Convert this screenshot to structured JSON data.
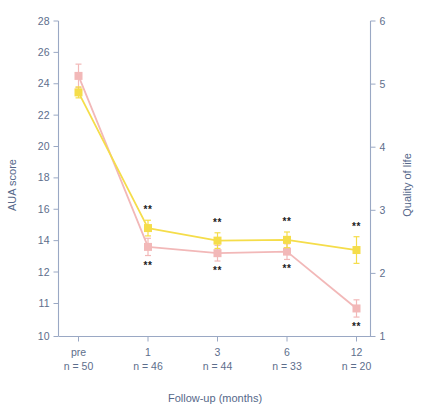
{
  "chart_data": {
    "type": "line",
    "title": "",
    "xlabel": "Follow-up (months)",
    "ylabel": "AUA score",
    "y2label": "Quality of life",
    "categories": [
      "pre",
      "1",
      "3",
      "6",
      "12"
    ],
    "category_sublabels": [
      "n = 50",
      "n = 46",
      "n = 44",
      "n = 33",
      "n = 20"
    ],
    "ylim": [
      10,
      28
    ],
    "yticks": [
      10,
      11,
      12,
      14,
      16,
      18,
      20,
      22,
      24,
      26,
      28
    ],
    "ytick_labels": [
      "10",
      "11",
      "12",
      "14",
      "16",
      "18",
      "20",
      "22",
      "24",
      "26",
      "28"
    ],
    "y2lim": [
      1,
      6
    ],
    "y2ticks": [
      1,
      2,
      3,
      4,
      5,
      6
    ],
    "y2tick_labels": [
      "1",
      "2",
      "3",
      "4",
      "5",
      "6"
    ],
    "grid": false,
    "legend_position": "none",
    "series": [
      {
        "name": "AUA score",
        "axis": "left",
        "color": "#f2b8b8",
        "marker": "square",
        "values": [
          24.5,
          13.6,
          13.2,
          13.3,
          10.85
        ],
        "errors": [
          0.75,
          0.55,
          0.5,
          0.5,
          0.55
        ],
        "significance": [
          "",
          "**",
          "**",
          "**",
          "**"
        ],
        "significance_position": "below"
      },
      {
        "name": "Quality of life",
        "axis": "right",
        "color": "#f5dd4a",
        "marker": "square",
        "values": [
          23.45,
          14.8,
          14.0,
          14.05,
          13.4
        ],
        "errors": [
          0.35,
          0.5,
          0.5,
          0.5,
          0.85
        ],
        "significance": [
          "",
          "**",
          "**",
          "**",
          "**"
        ],
        "significance_position": "above"
      }
    ],
    "annotations": {
      "significance_marker": "**"
    }
  },
  "colors": {
    "axis": "#8f9dbb",
    "text": "#5d6e8c",
    "series_aua": "#f2b8b8",
    "series_qol": "#f5dd4a",
    "significance": "#1c1c1c",
    "background": "#ffffff"
  }
}
